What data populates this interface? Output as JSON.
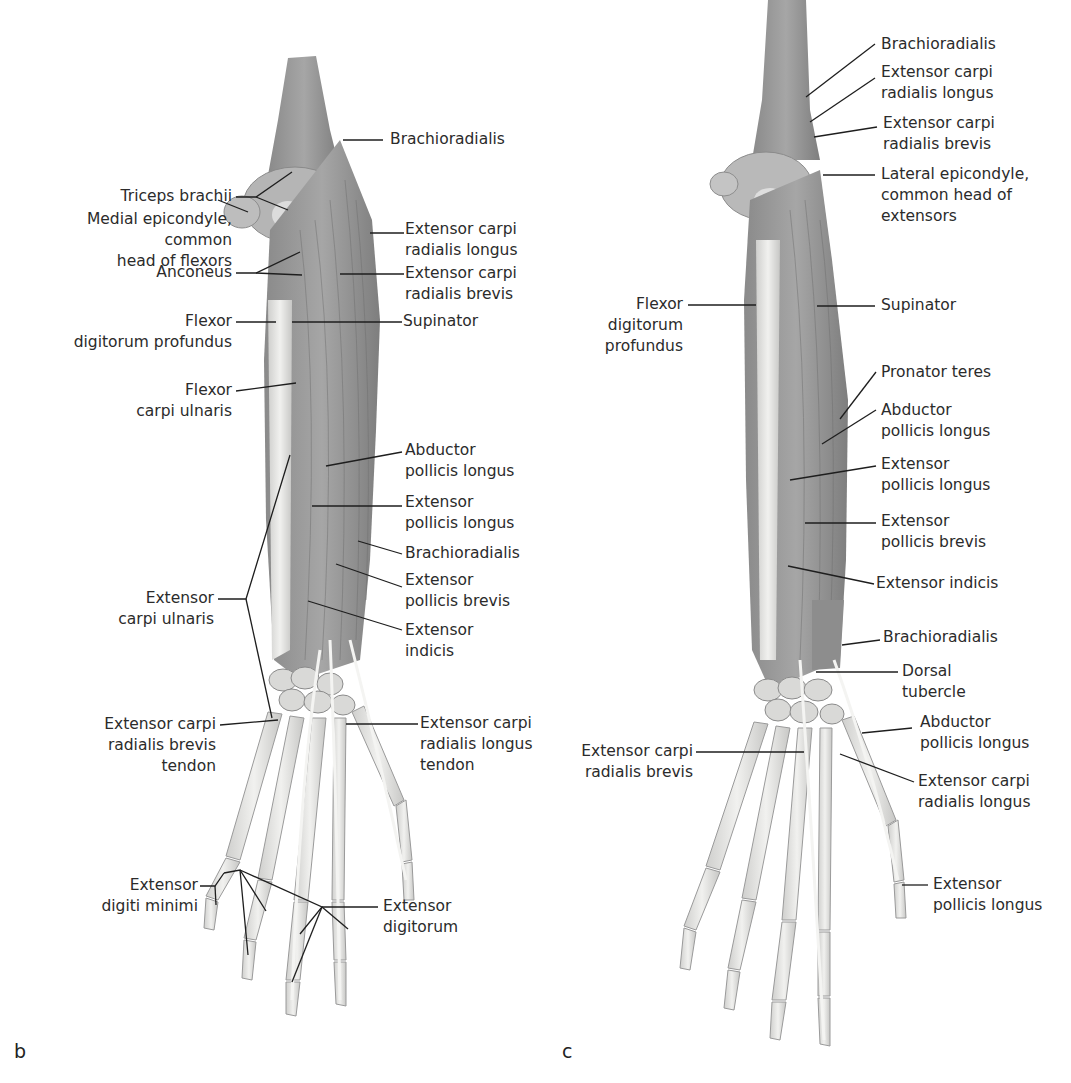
{
  "figure": {
    "panels": [
      {
        "id": "b",
        "letter": "b",
        "labels": [
          {
            "key": "triceps_brachii",
            "lines": [
              "Triceps brachii"
            ]
          },
          {
            "key": "medial_epicondyle",
            "lines": [
              "Medial epicondyle,",
              "common",
              "head of flexors"
            ]
          },
          {
            "key": "anconeus",
            "lines": [
              "Anconeus"
            ]
          },
          {
            "key": "flexor_digitorum_profundus",
            "lines": [
              "Flexor",
              "digitorum profundus"
            ]
          },
          {
            "key": "flexor_carpi_ulnaris",
            "lines": [
              "Flexor",
              "carpi ulnaris"
            ]
          },
          {
            "key": "extensor_carpi_ulnaris",
            "lines": [
              "Extensor",
              "carpi ulnaris"
            ]
          },
          {
            "key": "ecrb_tendon",
            "lines": [
              "Extensor carpi",
              "radialis brevis",
              "tendon"
            ]
          },
          {
            "key": "extensor_digiti_minimi",
            "lines": [
              "Extensor",
              "digiti minimi"
            ]
          },
          {
            "key": "brachioradialis_top",
            "lines": [
              "Brachioradialis"
            ]
          },
          {
            "key": "ecrl",
            "lines": [
              "Extensor carpi",
              "radialis longus"
            ]
          },
          {
            "key": "ecrb",
            "lines": [
              "Extensor carpi",
              "radialis brevis"
            ]
          },
          {
            "key": "supinator",
            "lines": [
              "Supinator"
            ]
          },
          {
            "key": "abductor_pollicis_longus",
            "lines": [
              "Abductor",
              "pollicis longus"
            ]
          },
          {
            "key": "extensor_pollicis_longus",
            "lines": [
              "Extensor",
              "pollicis longus"
            ]
          },
          {
            "key": "brachioradialis_mid",
            "lines": [
              "Brachioradialis"
            ]
          },
          {
            "key": "extensor_pollicis_brevis",
            "lines": [
              "Extensor",
              "pollicis brevis"
            ]
          },
          {
            "key": "extensor_indicis",
            "lines": [
              "Extensor",
              "indicis"
            ]
          },
          {
            "key": "ecrl_tendon",
            "lines": [
              "Extensor carpi",
              "radialis longus",
              "tendon"
            ]
          },
          {
            "key": "extensor_digitorum",
            "lines": [
              "Extensor",
              "digitorum"
            ]
          }
        ]
      },
      {
        "id": "c",
        "letter": "c",
        "labels": [
          {
            "key": "brachioradialis_top",
            "lines": [
              "Brachioradialis"
            ]
          },
          {
            "key": "ecrl_top",
            "lines": [
              "Extensor carpi",
              "radialis longus"
            ]
          },
          {
            "key": "ecrb_top",
            "lines": [
              "Extensor carpi",
              "radialis brevis"
            ]
          },
          {
            "key": "lateral_epicondyle",
            "lines": [
              "Lateral epicondyle,",
              "common head of",
              "extensors"
            ]
          },
          {
            "key": "flexor_digitorum_profundus",
            "lines": [
              "Flexor",
              "digitorum",
              "profundus"
            ]
          },
          {
            "key": "supinator",
            "lines": [
              "Supinator"
            ]
          },
          {
            "key": "pronator_teres",
            "lines": [
              "Pronator teres"
            ]
          },
          {
            "key": "abductor_pollicis_longus",
            "lines": [
              "Abductor",
              "pollicis longus"
            ]
          },
          {
            "key": "extensor_pollicis_longus",
            "lines": [
              "Extensor",
              "pollicis longus"
            ]
          },
          {
            "key": "extensor_pollicis_brevis",
            "lines": [
              "Extensor",
              "pollicis brevis"
            ]
          },
          {
            "key": "extensor_indicis",
            "lines": [
              "Extensor indicis"
            ]
          },
          {
            "key": "brachioradialis_low",
            "lines": [
              "Brachioradialis"
            ]
          },
          {
            "key": "dorsal_tubercle",
            "lines": [
              "Dorsal",
              "tubercle"
            ]
          },
          {
            "key": "abductor_pollicis_longus_low",
            "lines": [
              "Abductor",
              "pollicis longus"
            ]
          },
          {
            "key": "ecrb_low",
            "lines": [
              "Extensor carpi",
              "radialis brevis"
            ]
          },
          {
            "key": "ecrl_low",
            "lines": [
              "Extensor carpi",
              "radialis longus"
            ]
          },
          {
            "key": "extensor_pollicis_longus_low",
            "lines": [
              "Extensor",
              "pollicis longus"
            ]
          }
        ]
      }
    ],
    "caption_partial": "… muscles of the forearm … (b) … (c) … (cropped, illegible)",
    "colors": {
      "muscle": "#9a9a9a",
      "muscle_dark": "#7d7d7d",
      "bone": "#e6e6e4",
      "bone_edge": "#9c9c9c",
      "leader": "#1e1e1e"
    }
  }
}
